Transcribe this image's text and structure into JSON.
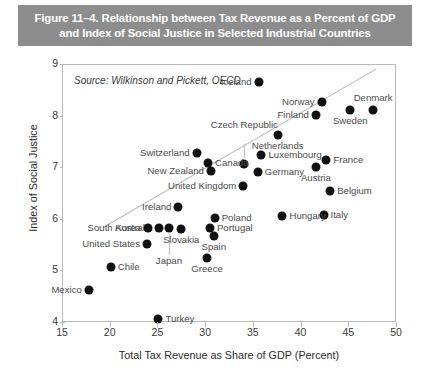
{
  "title": {
    "line1": "Figure 11–4. Relationship between Tax Revenue as a Percent of GDP",
    "line2": "and Index of Social Justice in Selected Industrial Countries",
    "band_color": "#8d8d8d",
    "text_color": "#ffffff"
  },
  "source_note": "Source: Wilkinson and Pickett, OECD",
  "chart_data": {
    "type": "scatter",
    "title": "Figure 11–4. Relationship between Tax Revenue as a Percent of GDP and Index of Social Justice in Selected Industrial Countries",
    "xlabel": "Total Tax Revenue as Share of GDP (Percent)",
    "ylabel": "Index of Social Justice",
    "xlim": [
      15,
      50
    ],
    "ylim": [
      4,
      9
    ],
    "xticks": [
      15,
      20,
      25,
      30,
      35,
      40,
      45,
      50
    ],
    "yticks": [
      4,
      5,
      6,
      7,
      8,
      9
    ],
    "grid": false,
    "legend": "none",
    "marker_color": "#111111",
    "trendline": {
      "show": true,
      "color": "#bdbdbd",
      "x_start": 19.2,
      "y_start": 5.85,
      "x_end": 47.8,
      "y_end": 8.92
    },
    "points": [
      {
        "label": "Iceland",
        "x": 35.5,
        "y": 8.68,
        "label_pos": "left"
      },
      {
        "label": "Norway",
        "x": 42.1,
        "y": 8.28,
        "label_pos": "left"
      },
      {
        "label": "Denmark",
        "x": 47.5,
        "y": 8.12,
        "label_pos": "above"
      },
      {
        "label": "Sweden",
        "x": 45.1,
        "y": 8.12,
        "label_pos": "below"
      },
      {
        "label": "Finland",
        "x": 41.5,
        "y": 8.03,
        "label_pos": "left"
      },
      {
        "label": "Netherlands",
        "x": 37.5,
        "y": 7.65,
        "label_pos": "below"
      },
      {
        "label": "Luxembourg",
        "x": 35.8,
        "y": 7.26,
        "label_pos": "right"
      },
      {
        "label": "France",
        "x": 42.6,
        "y": 7.16,
        "label_pos": "right"
      },
      {
        "label": "Austria",
        "x": 41.5,
        "y": 7.03,
        "label_pos": "below"
      },
      {
        "label": "Czech Republic",
        "x": 34.0,
        "y": 7.09,
        "label_pos": "above-leader"
      },
      {
        "label": "Switzerland",
        "x": 29.0,
        "y": 7.29,
        "label_pos": "left"
      },
      {
        "label": "Canada",
        "x": 30.2,
        "y": 7.1,
        "label_pos": "right"
      },
      {
        "label": "New Zealand",
        "x": 30.5,
        "y": 6.94,
        "label_pos": "left"
      },
      {
        "label": "Germany",
        "x": 35.4,
        "y": 6.93,
        "label_pos": "right"
      },
      {
        "label": "United Kingdom",
        "x": 33.9,
        "y": 6.66,
        "label_pos": "left"
      },
      {
        "label": "Belgium",
        "x": 43.0,
        "y": 6.55,
        "label_pos": "right"
      },
      {
        "label": "Italy",
        "x": 42.3,
        "y": 6.1,
        "label_pos": "right"
      },
      {
        "label": "Hungary",
        "x": 38.0,
        "y": 6.08,
        "label_pos": "right"
      },
      {
        "label": "Ireland",
        "x": 27.1,
        "y": 6.25,
        "label_pos": "left"
      },
      {
        "label": "Australia",
        "x": 25.1,
        "y": 5.85,
        "label_pos": "left"
      },
      {
        "label": "South Korea",
        "x": 23.9,
        "y": 5.85,
        "label_pos": "left"
      },
      {
        "label": "Japan",
        "x": 26.1,
        "y": 5.85,
        "label_pos": "below-leader"
      },
      {
        "label": "Slovakia",
        "x": 27.4,
        "y": 5.83,
        "label_pos": "below"
      },
      {
        "label": "United States",
        "x": 23.8,
        "y": 5.53,
        "label_pos": "left"
      },
      {
        "label": "Poland",
        "x": 30.9,
        "y": 6.04,
        "label_pos": "right"
      },
      {
        "label": "Portugal",
        "x": 30.4,
        "y": 5.85,
        "label_pos": "right"
      },
      {
        "label": "Spain",
        "x": 30.8,
        "y": 5.68,
        "label_pos": "below"
      },
      {
        "label": "Greece",
        "x": 30.1,
        "y": 5.26,
        "label_pos": "below"
      },
      {
        "label": "Chile",
        "x": 20.0,
        "y": 5.08,
        "label_pos": "right"
      },
      {
        "label": "Mexico",
        "x": 17.7,
        "y": 4.63,
        "label_pos": "left"
      },
      {
        "label": "Turkey",
        "x": 25.0,
        "y": 4.07,
        "label_pos": "right"
      }
    ]
  }
}
